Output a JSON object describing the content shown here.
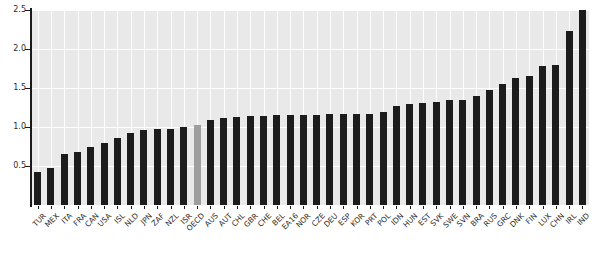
{
  "chart_data": {
    "type": "bar",
    "title": "",
    "subtitle": "",
    "xlabel": "",
    "ylabel": "",
    "ylim": [
      0,
      2.5
    ],
    "ytick_labels": [
      "0.5",
      "1.0",
      "1.5",
      "2.0",
      "2.5"
    ],
    "ytick_values": [
      0.5,
      1.0,
      1.5,
      2.0,
      2.5
    ],
    "grid": true,
    "legend": "none",
    "bar_color": "#1c1c1c",
    "highlight_color": "#9e9e9e",
    "highlight_category": "OECD",
    "plot_background": "#e9e9e9",
    "categories": [
      "TUR",
      "MEX",
      "ITA",
      "FRA",
      "CAN",
      "USA",
      "ISL",
      "NLD",
      "JPN",
      "ZAF",
      "NZL",
      "ISR",
      "OECD",
      "AUS",
      "AUT",
      "CHL",
      "GBR",
      "CHE",
      "BEL",
      "EA16",
      "NOR",
      "CZE",
      "DEU",
      "ESP",
      "KOR",
      "PRT",
      "POL",
      "IDN",
      "HUN",
      "EST",
      "SVK",
      "SWE",
      "SVN",
      "BRA",
      "RUS",
      "GRC",
      "DNK",
      "FIN",
      "LUX",
      "CHN",
      "IRL",
      "IND"
    ],
    "values": [
      0.42,
      0.48,
      0.65,
      0.68,
      0.74,
      0.8,
      0.86,
      0.92,
      0.96,
      0.97,
      0.98,
      1.0,
      1.03,
      1.09,
      1.12,
      1.13,
      1.14,
      1.14,
      1.15,
      1.16,
      1.16,
      1.16,
      1.17,
      1.17,
      1.17,
      1.17,
      1.19,
      1.27,
      1.3,
      1.31,
      1.32,
      1.34,
      1.35,
      1.4,
      1.47,
      1.55,
      1.63,
      1.66,
      1.78,
      1.8,
      2.23,
      2.5
    ]
  }
}
